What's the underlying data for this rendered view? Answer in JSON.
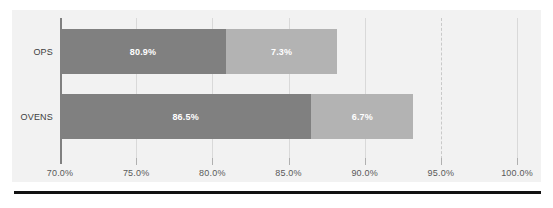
{
  "chart_data": {
    "type": "bar",
    "orientation": "horizontal",
    "stacked": true,
    "title": "",
    "subtitle": "",
    "xlabel": "",
    "ylabel": "",
    "categories": [
      "OPS",
      "OVENS"
    ],
    "xlim": [
      70.0,
      100.0
    ],
    "xtick_values": [
      70.0,
      75.0,
      80.0,
      85.0,
      90.0,
      95.0,
      100.0
    ],
    "xtick_labels": [
      "70.0%",
      "75.0%",
      "80.0%",
      "85.0%",
      "90.0%",
      "95.0%",
      "100.0%"
    ],
    "grid": true,
    "legend": false,
    "legend_position": "none",
    "series": [
      {
        "name": "Segment 1",
        "color": "#808080",
        "values": [
          80.9,
          86.5
        ],
        "labels": [
          "80.9%",
          "86.5%"
        ]
      },
      {
        "name": "Segment 2",
        "color": "#b3b3b3",
        "values": [
          7.3,
          6.7
        ],
        "labels": [
          "7.3%",
          "6.7%"
        ]
      }
    ],
    "annotations": [
      {
        "name": "target-line",
        "type": "vline",
        "value": 95.0,
        "style": "dashed",
        "color": "#c9c9c9"
      }
    ],
    "bars": [
      {
        "category": "OPS",
        "start": 70.0,
        "segments": [
          {
            "label": "80.9%",
            "from": 70.0,
            "to": 80.9
          },
          {
            "label": "7.3%",
            "from": 80.9,
            "to": 88.2
          }
        ]
      },
      {
        "category": "OVENS",
        "start": 70.0,
        "segments": [
          {
            "label": "86.5%",
            "from": 70.0,
            "to": 86.5
          },
          {
            "label": "6.7%",
            "from": 86.5,
            "to": 93.2
          }
        ]
      }
    ],
    "colors": {
      "segment_1": "#808080",
      "segment_2": "#b3b3b3",
      "panel_background": "#f2f2f2",
      "gridline": "#d9d9d9",
      "axis_line": "#808080",
      "tick_text": "#595959",
      "category_text": "#404040",
      "bar_label_text": "#ffffff",
      "bottom_rule": "#111111"
    }
  }
}
